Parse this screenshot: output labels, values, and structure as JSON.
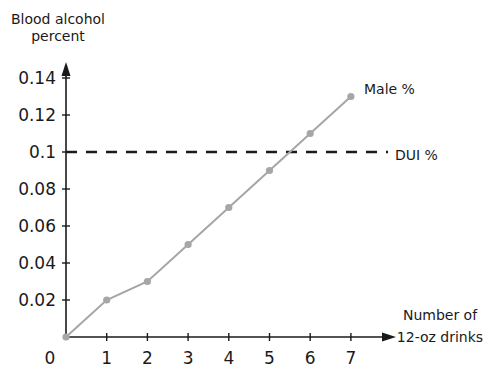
{
  "chart_data": {
    "type": "line",
    "title": "",
    "ylabel": "Blood alcohol percent",
    "ylabel_lines": [
      "Blood alcohol",
      "percent"
    ],
    "xlabel": "Number of 12-oz drinks",
    "xlabel_lines": [
      "Number of",
      "12-oz drinks"
    ],
    "x": [
      0,
      1,
      2,
      3,
      4,
      5,
      6,
      7
    ],
    "x_tick_labels": [
      "0",
      "1",
      "2",
      "3",
      "4",
      "5",
      "6",
      "7"
    ],
    "y_tick_labels": [
      "0.02",
      "0.04",
      "0.06",
      "0.08",
      "0.1",
      "0.12",
      "0.14"
    ],
    "y_ticks": [
      0.02,
      0.04,
      0.06,
      0.08,
      0.1,
      0.12,
      0.14
    ],
    "xlim": [
      0,
      7
    ],
    "ylim": [
      0,
      0.14
    ],
    "grid": false,
    "series": [
      {
        "name": "Male %",
        "values": [
          0,
          0.02,
          0.03,
          0.05,
          0.07,
          0.09,
          0.11,
          0.13
        ],
        "color": "#a6a6a6",
        "marker": "circle"
      }
    ],
    "reference_lines": [
      {
        "name": "DUI %",
        "y": 0.1,
        "style": "dashed",
        "color": "#1a1a1a"
      }
    ],
    "annotations": [
      {
        "text": "Male %",
        "at_x": 7
      },
      {
        "text": "DUI %",
        "at_y": 0.1
      }
    ]
  }
}
